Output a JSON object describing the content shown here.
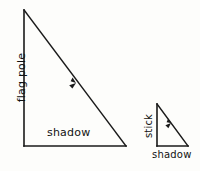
{
  "figure": {
    "background_color": "#fdfdfb",
    "stroke_color": "#1a1a1a"
  },
  "large_triangle": {
    "name": "flag-pole-triangle",
    "vertical_label": "flag pole",
    "base_label": "shadow",
    "vertices": {
      "apex": [
        24,
        10
      ],
      "bottom_left": [
        24,
        146
      ],
      "bottom_right": [
        126,
        146
      ]
    },
    "ray_arrow": {
      "label": "sun-ray-arrow",
      "position": [
        76,
        83
      ],
      "direction": "down-right"
    }
  },
  "small_triangle": {
    "name": "stick-triangle",
    "vertical_label": "stick",
    "base_label": "shadow",
    "vertices": {
      "apex": [
        157,
        104
      ],
      "bottom_left": [
        157,
        146
      ],
      "bottom_right": [
        188,
        146
      ]
    },
    "ray_arrow": {
      "label": "sun-ray-arrow",
      "position": [
        171,
        123
      ],
      "direction": "down-right"
    }
  }
}
